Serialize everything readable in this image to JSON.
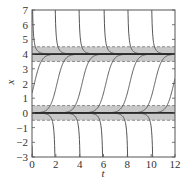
{
  "chart_data": {
    "type": "line",
    "title": "",
    "xlabel": "t",
    "ylabel": "x",
    "xlim": [
      0,
      12
    ],
    "ylim": [
      -3,
      7
    ],
    "xticks": [
      0,
      2,
      4,
      6,
      8,
      10,
      12
    ],
    "yticks": [
      -3,
      -2,
      -1,
      0,
      1,
      2,
      3,
      4,
      5,
      6,
      7
    ],
    "grid": false,
    "legend": null,
    "equilibria": [
      {
        "x": 4,
        "band": [
          3.5,
          4.5
        ]
      },
      {
        "x": 0,
        "band": [
          -0.5,
          0.5
        ]
      }
    ],
    "colors": {
      "curve": "#555555",
      "equilibrium": "#2a2a2a",
      "band": "#c8c8c8",
      "band_edge": "#777777",
      "axis": "#555555",
      "text": "#333333"
    },
    "series": [
      {
        "name": "above-4 (descending to 4)",
        "centers_t": [
          0.0,
          1.9,
          3.9,
          6.0,
          8.0,
          10.0
        ]
      },
      {
        "name": "between 0 and 4 (rising to 4)",
        "centers_t": [
          0.2,
          2.1,
          4.2,
          6.2,
          8.2,
          10.3,
          11.9
        ]
      },
      {
        "name": "below 0 (descending to -3)",
        "centers_t": [
          0.1,
          2.0,
          4.1,
          6.0,
          8.1,
          10.2
        ]
      }
    ]
  }
}
